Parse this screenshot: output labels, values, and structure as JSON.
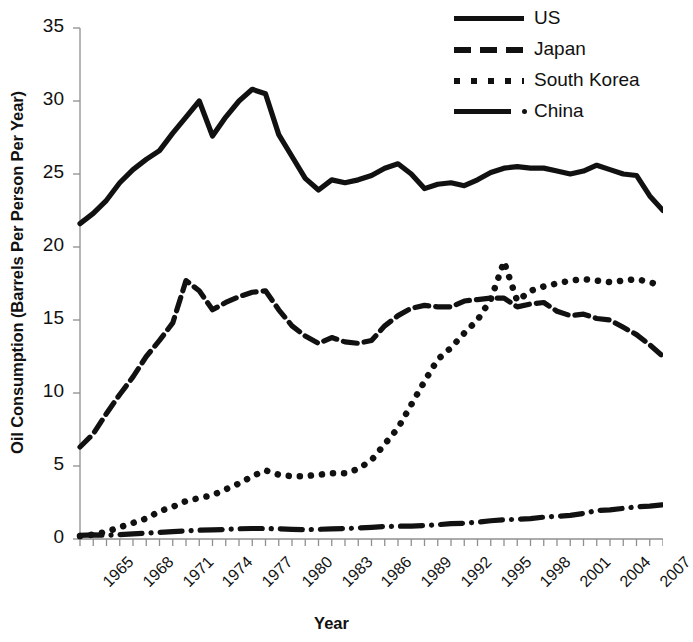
{
  "chart_data": {
    "type": "line",
    "title": "",
    "xlabel": "Year",
    "ylabel": "Oil Consumption (Barrels Per Person Per Year)",
    "xlim": [
      1965,
      2009
    ],
    "ylim": [
      0,
      35
    ],
    "ytick_values": [
      0,
      5,
      10,
      15,
      20,
      25,
      30,
      35
    ],
    "ytick_labels": [
      "0",
      "5",
      "10",
      "15",
      "20",
      "25",
      "30",
      "35"
    ],
    "xtick_labels": [
      "1965",
      "1968",
      "1971",
      "1974",
      "1977",
      "1980",
      "1983",
      "1986",
      "1989",
      "1992",
      "1995",
      "1998",
      "2001",
      "2004",
      "2007"
    ],
    "xtick_values": [
      1965,
      1968,
      1971,
      1974,
      1977,
      1980,
      1983,
      1986,
      1989,
      1992,
      1995,
      1998,
      2001,
      2004,
      2007
    ],
    "x": [
      1965,
      1966,
      1967,
      1968,
      1969,
      1970,
      1971,
      1972,
      1973,
      1974,
      1975,
      1976,
      1977,
      1978,
      1979,
      1980,
      1981,
      1982,
      1983,
      1984,
      1985,
      1986,
      1987,
      1988,
      1989,
      1990,
      1991,
      1992,
      1993,
      1994,
      1995,
      1996,
      1997,
      1998,
      1999,
      2000,
      2001,
      2002,
      2003,
      2004,
      2005,
      2006,
      2007,
      2008,
      2009
    ],
    "grid": false,
    "legend_position": "top-right",
    "series": [
      {
        "name": "US",
        "style": "solid",
        "color": "#111111",
        "values": [
          21.6,
          22.3,
          23.2,
          24.4,
          25.3,
          26.0,
          26.6,
          27.8,
          28.9,
          30.0,
          27.6,
          28.9,
          30.0,
          30.8,
          30.5,
          27.7,
          26.2,
          24.7,
          23.9,
          24.6,
          24.4,
          24.6,
          24.9,
          25.4,
          25.7,
          25.0,
          24.0,
          24.3,
          24.4,
          24.2,
          24.6,
          25.1,
          25.4,
          25.5,
          25.4,
          25.4,
          25.2,
          25.0,
          25.2,
          25.6,
          25.3,
          25.0,
          24.9,
          23.5,
          22.5
        ]
      },
      {
        "name": "Japan",
        "style": "dashed",
        "color": "#111111",
        "values": [
          6.3,
          7.2,
          8.6,
          9.9,
          11.1,
          12.5,
          13.6,
          14.8,
          17.7,
          17.0,
          15.7,
          16.2,
          16.6,
          16.9,
          17.0,
          15.7,
          14.6,
          13.9,
          13.4,
          13.8,
          13.5,
          13.4,
          13.6,
          14.6,
          15.3,
          15.8,
          16.0,
          15.9,
          15.9,
          16.3,
          16.4,
          16.5,
          16.5,
          15.9,
          16.1,
          16.2,
          15.6,
          15.3,
          15.4,
          15.1,
          15.0,
          14.5,
          14.0,
          13.3,
          12.5
        ]
      },
      {
        "name": "South Korea",
        "style": "dotted",
        "color": "#111111",
        "values": [
          0.2,
          0.3,
          0.5,
          0.8,
          1.1,
          1.4,
          1.9,
          2.2,
          2.6,
          2.8,
          3.0,
          3.4,
          3.8,
          4.3,
          4.7,
          4.4,
          4.3,
          4.3,
          4.4,
          4.5,
          4.5,
          4.8,
          5.4,
          6.5,
          7.6,
          9.2,
          10.8,
          12.3,
          13.1,
          14.1,
          15.0,
          16.4,
          19.0,
          16.3,
          17.0,
          17.3,
          17.5,
          17.7,
          17.8,
          17.7,
          17.6,
          17.7,
          17.8,
          17.6,
          17.3
        ]
      },
      {
        "name": "China",
        "style": "dashdot",
        "color": "#111111",
        "values": [
          0.25,
          0.28,
          0.25,
          0.3,
          0.35,
          0.4,
          0.45,
          0.5,
          0.55,
          0.6,
          0.62,
          0.65,
          0.7,
          0.72,
          0.72,
          0.7,
          0.66,
          0.64,
          0.66,
          0.7,
          0.72,
          0.75,
          0.8,
          0.85,
          0.88,
          0.88,
          0.92,
          0.98,
          1.05,
          1.08,
          1.15,
          1.25,
          1.32,
          1.35,
          1.4,
          1.5,
          1.55,
          1.62,
          1.75,
          1.95,
          2.0,
          2.1,
          2.2,
          2.25,
          2.35
        ]
      }
    ]
  },
  "legend": {
    "items": [
      {
        "label": "US",
        "style": "solid"
      },
      {
        "label": "Japan",
        "style": "dashed"
      },
      {
        "label": "South Korea",
        "style": "dotted"
      },
      {
        "label": "China",
        "style": "dashdot"
      }
    ]
  },
  "axes": {
    "y_title": "Oil Consumption (Barrels Per Person Per Year)",
    "x_title": "Year"
  }
}
